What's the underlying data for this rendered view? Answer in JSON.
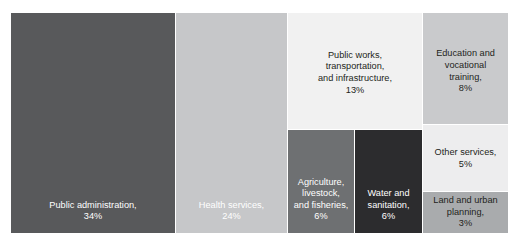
{
  "chart_data": {
    "type": "treemap",
    "title": "",
    "xlabel": "",
    "ylabel": "",
    "legend": "none",
    "grid": false,
    "value_unit": "percent",
    "categories": [
      "Public administration",
      "Health services",
      "Public works, transportation, and infrastructure",
      "Education and vocational training",
      "Agriculture, livestock, and fisheries",
      "Water and sanitation",
      "Other services",
      "Land and urban planning"
    ],
    "values": [
      34,
      24,
      13,
      8,
      6,
      6,
      5,
      3
    ],
    "nodes": [
      {
        "id": "public-administration",
        "name": "Public administration",
        "value": 34,
        "value_label": "34%",
        "label": "Public administration,\n34%",
        "color": "#58595b",
        "text_color": "#ffffff"
      },
      {
        "id": "health-services",
        "name": "Health services",
        "value": 24,
        "value_label": "24%",
        "label": "Health services,\n24%",
        "color": "#c6c7c9",
        "text_color": "#ffffff"
      },
      {
        "id": "public-works",
        "name": "Public works, transportation, and infrastructure",
        "value": 13,
        "value_label": "13%",
        "label": "Public works,\ntransportation,\nand infrastructure,\n13%",
        "color": "#f1f1f1",
        "text_color": "#231f20"
      },
      {
        "id": "education",
        "name": "Education and vocational training",
        "value": 8,
        "value_label": "8%",
        "label": "Education and\nvocational\ntraining,\n8%",
        "color": "#c9cacc",
        "text_color": "#231f20"
      },
      {
        "id": "agriculture",
        "name": "Agriculture, livestock, and fisheries",
        "value": 6,
        "value_label": "6%",
        "label": "Agriculture,\nlivestock,\nand fisheries,\n6%",
        "color": "#6e7072",
        "text_color": "#ffffff"
      },
      {
        "id": "water-sanitation",
        "name": "Water and sanitation",
        "value": 6,
        "value_label": "6%",
        "label": "Water and\nsanitation,\n6%",
        "color": "#2c2c2e",
        "text_color": "#ffffff"
      },
      {
        "id": "other-services",
        "name": "Other services",
        "value": 5,
        "value_label": "5%",
        "label": "Other services,\n5%",
        "color": "#ededee",
        "text_color": "#231f20"
      },
      {
        "id": "land-urban-planning",
        "name": "Land and urban planning",
        "value": 3,
        "value_label": "3%",
        "label": "Land and urban\nplanning,\n3%",
        "color": "#a9abad",
        "text_color": "#231f20"
      }
    ],
    "colors": {
      "public_administration": "#58595b",
      "health_services": "#c6c7c9",
      "public_works": "#f1f1f1",
      "education": "#c9cacc",
      "agriculture": "#6e7072",
      "water_sanitation": "#2c2c2e",
      "other_services": "#ededee",
      "land_urban_planning": "#a9abad",
      "background": "#ffffff",
      "title_text": "#231f20"
    }
  }
}
